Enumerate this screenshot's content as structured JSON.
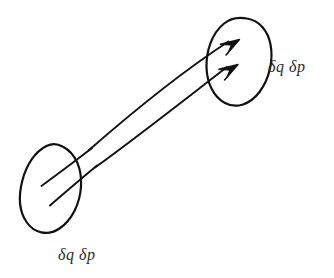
{
  "figure": {
    "background_color": "#ffffff",
    "ink_color": "#111111",
    "label_color": "#2a2a2a",
    "width": 334,
    "height": 278
  },
  "labels": {
    "initial_region": "δq  δp",
    "final_region": "δq  δp"
  },
  "regions": [
    {
      "id": "initial-region",
      "name": "initial-phase-space-region",
      "center_x": 51,
      "center_y": 185,
      "radius_x": 31,
      "radius_y": 46,
      "rotation_deg": 22,
      "label": "δq  δp"
    },
    {
      "id": "final-region",
      "name": "final-phase-space-region",
      "center_x": 236,
      "center_y": 61,
      "radius_x": 28,
      "radius_y": 44,
      "rotation_deg": 20,
      "label": "δq  δp"
    }
  ],
  "trajectories": [
    {
      "id": "trajectory-upper",
      "name": "upper-flow-arrow",
      "start_x": 41,
      "start_y": 186,
      "control_x": 140,
      "control_y": 96,
      "end_x": 238,
      "end_y": 44,
      "has_arrowhead": true
    },
    {
      "id": "trajectory-lower",
      "name": "lower-flow-arrow",
      "start_x": 50,
      "start_y": 205,
      "control_x": 148,
      "control_y": 124,
      "end_x": 236,
      "end_y": 69,
      "has_arrowhead": true
    }
  ],
  "label_positions": {
    "initial": {
      "x": 58,
      "y": 260
    },
    "final": {
      "x": 268,
      "y": 72
    }
  }
}
